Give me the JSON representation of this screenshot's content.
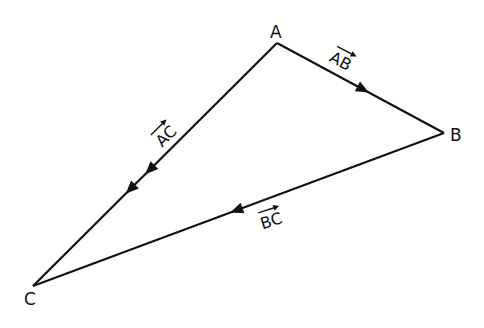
{
  "diagram": {
    "vertices": [
      {
        "id": "A",
        "label": "A"
      },
      {
        "id": "B",
        "label": "B"
      },
      {
        "id": "C",
        "label": "C"
      }
    ],
    "vectors": [
      {
        "id": "AB",
        "label": "AB",
        "from": "A",
        "to": "B",
        "arrowheads": 1
      },
      {
        "id": "AC",
        "label": "AC",
        "from": "A",
        "to": "C",
        "arrowheads": 2
      },
      {
        "id": "BC",
        "label": "BC",
        "from": "B",
        "to": "C",
        "arrowheads": 1
      }
    ],
    "line_color": "#111111"
  }
}
